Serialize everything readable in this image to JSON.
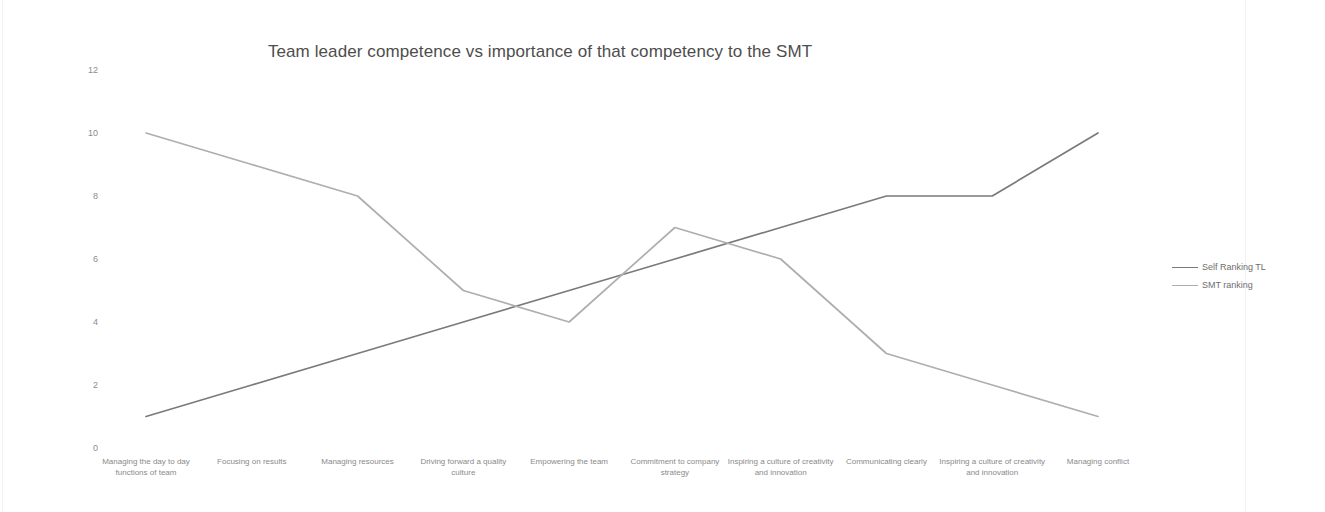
{
  "chart_data": {
    "type": "line",
    "title": "Team leader competence vs importance of that competency to the SMT",
    "xlabel": "",
    "ylabel": "",
    "ylim": [
      0,
      12
    ],
    "y_ticks": [
      0,
      2,
      4,
      6,
      8,
      10,
      12
    ],
    "grid": false,
    "legend_position": "right",
    "categories": [
      "Managing the day to day functions of team",
      "Focusing on  results",
      "Managing resources",
      "Driving forward a quality culture",
      "Empowering the team",
      "Commitment to company strategy",
      "Inspiring a culture of creativity and innovation",
      "Communicating clearly",
      "Inspiring a culture of creativity and innovation",
      "Managing conflict"
    ],
    "series": [
      {
        "name": "Self Ranking TL",
        "color": "#7a7a7a",
        "values": [
          1,
          2,
          3,
          4,
          5,
          6,
          7,
          8,
          8,
          10
        ]
      },
      {
        "name": "SMT ranking",
        "color": "#aeaeae",
        "values": [
          10,
          9,
          8,
          5,
          4,
          7,
          6,
          3,
          2,
          1
        ]
      }
    ]
  }
}
